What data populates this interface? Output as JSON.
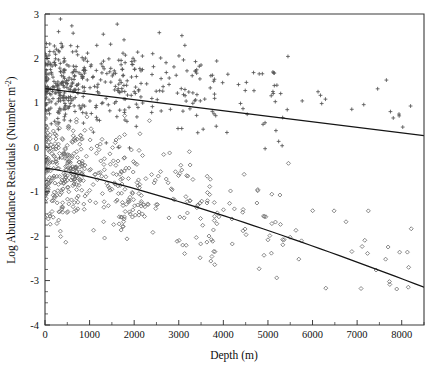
{
  "chart_data": {
    "type": "scatter",
    "title": "",
    "xlabel": "Depth (m)",
    "ylabel": "Log Abundance Residuals (Number  m-2)",
    "ylabel_parts": {
      "main": "Log Abundance Residuals (Number  m",
      "exponent": "-2",
      "tail": ")"
    },
    "xlim": [
      0,
      8500
    ],
    "ylim": [
      -4,
      3
    ],
    "grid": false,
    "legend": null,
    "xticks": [
      0,
      1000,
      2000,
      3000,
      4000,
      5000,
      6000,
      7000,
      8000
    ],
    "xtick_labels": [
      "0",
      "1000",
      "2000",
      "3000",
      "4000",
      "5000",
      "6000",
      "7000",
      "8000"
    ],
    "x_minor_step": 500,
    "yticks": [
      3,
      2,
      1,
      0,
      -1,
      -2,
      -3,
      -4
    ],
    "ytick_labels": [
      "3",
      "2",
      "1",
      "0",
      "-1",
      "-2",
      "-3",
      "-4"
    ],
    "y_minor_step": 0.25,
    "series": [
      {
        "name": "upper-group",
        "marker": "plus",
        "color": "#555555",
        "n_points": 470,
        "description": "Upper point cloud, plus-sign markers, centered near y=1.4 at shallow depth declining to near y=0.9 at depth",
        "fit": {
          "type": "line",
          "x_start": 0,
          "x_end": 8500,
          "y_start": 1.32,
          "y_end": 0.26
        }
      },
      {
        "name": "lower-group",
        "marker": "diamond",
        "color": "#6a6a6a",
        "n_points": 520,
        "description": "Lower point cloud, open diamond markers, centered near y=-0.45 at shallow depth declining to near y=-3.2 at depth",
        "fit": {
          "type": "curve",
          "x_start": 0,
          "x_end": 8500,
          "y_start": -0.47,
          "y_end": -3.15
        }
      }
    ]
  },
  "axes": {
    "x_axis_name": "depth-axis",
    "y_axis_name": "log-abundance-residuals-axis"
  }
}
